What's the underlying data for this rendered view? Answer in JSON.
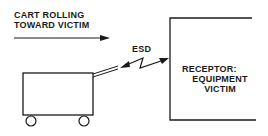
{
  "title_label": {
    "line1": "CART ROLLING",
    "line2": "TOWARD VICTIM"
  },
  "discharge_label": "ESD",
  "receptor_label": {
    "line1": "RECEPTOR:",
    "line2": "EQUIPMENT",
    "line3": "VICTIM"
  },
  "colors": {
    "ink": "#1a1a1a",
    "background": "#ffffff"
  }
}
